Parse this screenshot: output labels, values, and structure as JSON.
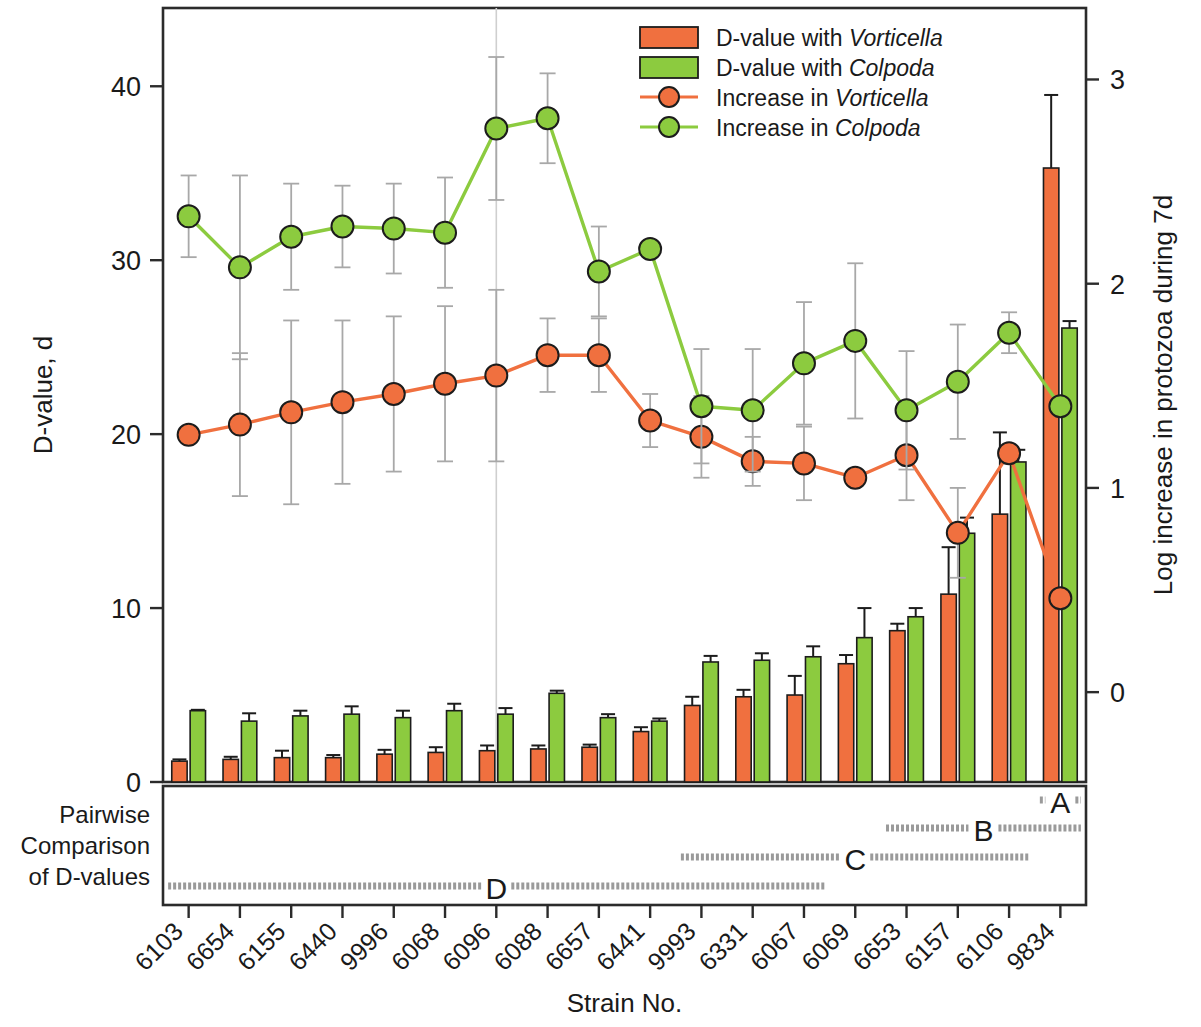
{
  "axes": {
    "left_title": "D-value, d",
    "right_title": "Log increase in protozoa during 7d",
    "x_title": "Strain No.",
    "left_ticks": [
      "0",
      "10",
      "20",
      "30",
      "40"
    ],
    "right_ticks": [
      "0",
      "1",
      "2",
      "3"
    ],
    "left_range": [
      0,
      44.5
    ],
    "right_range": [
      -0.44,
      3.35
    ]
  },
  "legend": [
    {
      "type": "bar",
      "swatch": "#F0703F",
      "prefix": "D-value with ",
      "italic": "Vorticella",
      "name": "legend-d-value-vorticella"
    },
    {
      "type": "bar",
      "swatch": "#8CCB3F",
      "prefix": "D-value with ",
      "italic": "Colpoda",
      "name": "legend-d-value-colpoda"
    },
    {
      "type": "marker",
      "swatch": "#F0703F",
      "prefix": "Increase in ",
      "italic": "Vorticella",
      "name": "legend-increase-vorticella"
    },
    {
      "type": "marker",
      "swatch": "#8CCB3F",
      "prefix": "Increase in ",
      "italic": "Colpoda",
      "name": "legend-increase-colpoda"
    }
  ],
  "pairwise": {
    "label_lines": [
      "Pairwise",
      "Comparison",
      "of D-values"
    ],
    "groups": [
      {
        "id": "A",
        "row": 0,
        "from_index": 17,
        "to_index": 17
      },
      {
        "id": "B",
        "row": 1,
        "from_index": 14,
        "to_index": 17
      },
      {
        "id": "C",
        "row": 2,
        "from_index": 10,
        "to_index": 16
      },
      {
        "id": "D",
        "row": 3,
        "from_index": 0,
        "to_index": 12
      }
    ]
  },
  "chart_data": {
    "type": "bar",
    "title": "",
    "xlabel": "Strain No.",
    "ylabel": "D-value, d",
    "y2label": "Log increase in protozoa during 7d",
    "ylim": [
      0,
      44.5
    ],
    "y2lim": [
      -0.44,
      3.35
    ],
    "grid": false,
    "legend_position": "top-right",
    "categories": [
      "6103",
      "6654",
      "6155",
      "6440",
      "9996",
      "6068",
      "6096",
      "6088",
      "6657",
      "6441",
      "9993",
      "6331",
      "6067",
      "6069",
      "6653",
      "6157",
      "6106",
      "9834"
    ],
    "series": [
      {
        "name": "D-value with Vorticella",
        "axis": "left",
        "kind": "bar",
        "color": "#F0703F",
        "values": [
          1.2,
          1.3,
          1.4,
          1.4,
          1.6,
          1.7,
          1.8,
          1.9,
          2.0,
          2.9,
          4.4,
          4.9,
          5.0,
          6.8,
          8.7,
          10.8,
          15.4,
          35.3
        ],
        "errors": [
          0.1,
          0.15,
          0.4,
          0.15,
          0.25,
          0.3,
          0.3,
          0.2,
          0.15,
          0.25,
          0.5,
          0.4,
          1.1,
          0.5,
          0.4,
          2.7,
          4.7,
          4.2
        ]
      },
      {
        "name": "D-value with Colpoda",
        "axis": "left",
        "kind": "bar",
        "color": "#8CCB3F",
        "values": [
          4.1,
          3.5,
          3.8,
          3.9,
          3.7,
          4.1,
          3.9,
          5.1,
          3.7,
          3.5,
          6.9,
          7.0,
          7.2,
          8.3,
          9.5,
          14.3,
          18.4,
          26.1
        ],
        "errors": [
          0.05,
          0.45,
          0.3,
          0.45,
          0.4,
          0.4,
          0.35,
          0.15,
          0.2,
          0.15,
          0.35,
          0.4,
          0.6,
          1.7,
          0.5,
          0.9,
          0.7,
          0.4
        ]
      },
      {
        "name": "Increase in Vorticella",
        "axis": "right",
        "kind": "line",
        "color": "#F0703F",
        "values": [
          1.26,
          1.31,
          1.37,
          1.42,
          1.46,
          1.51,
          1.55,
          1.65,
          1.65,
          1.33,
          1.25,
          1.13,
          1.12,
          1.05,
          1.16,
          0.78,
          1.17,
          0.46
        ],
        "errors": [
          0.0,
          0.35,
          0.45,
          0.4,
          0.38,
          0.38,
          0.42,
          0.18,
          0.18,
          0.13,
          0.2,
          0.12,
          0.18,
          0.0,
          0.22,
          0.22,
          0.0,
          0.0
        ]
      },
      {
        "name": "Increase in Colpoda",
        "axis": "right",
        "kind": "line",
        "color": "#8CCB3F",
        "values": [
          2.33,
          2.08,
          2.23,
          2.28,
          2.27,
          2.25,
          2.76,
          2.81,
          2.06,
          2.17,
          1.4,
          1.38,
          1.61,
          1.72,
          1.38,
          1.52,
          1.76,
          1.4
        ],
        "errors": [
          0.2,
          0.45,
          0.26,
          0.2,
          0.22,
          0.27,
          0.35,
          0.22,
          0.22,
          0.0,
          0.28,
          0.3,
          0.3,
          0.38,
          0.29,
          0.28,
          0.1,
          0.0
        ]
      }
    ]
  }
}
